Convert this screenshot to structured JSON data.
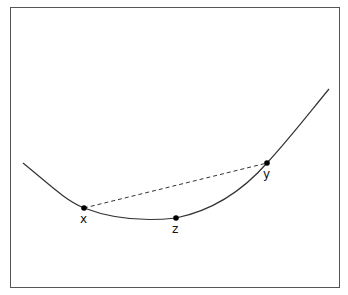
{
  "diagram": {
    "curve": {
      "type": "convex",
      "stroke": "#333333"
    },
    "chord": {
      "from": "x",
      "to": "y",
      "style": "dashed"
    },
    "points": [
      {
        "id": "x",
        "label": "x"
      },
      {
        "id": "y",
        "label": "y"
      },
      {
        "id": "z",
        "label": "z"
      }
    ]
  }
}
